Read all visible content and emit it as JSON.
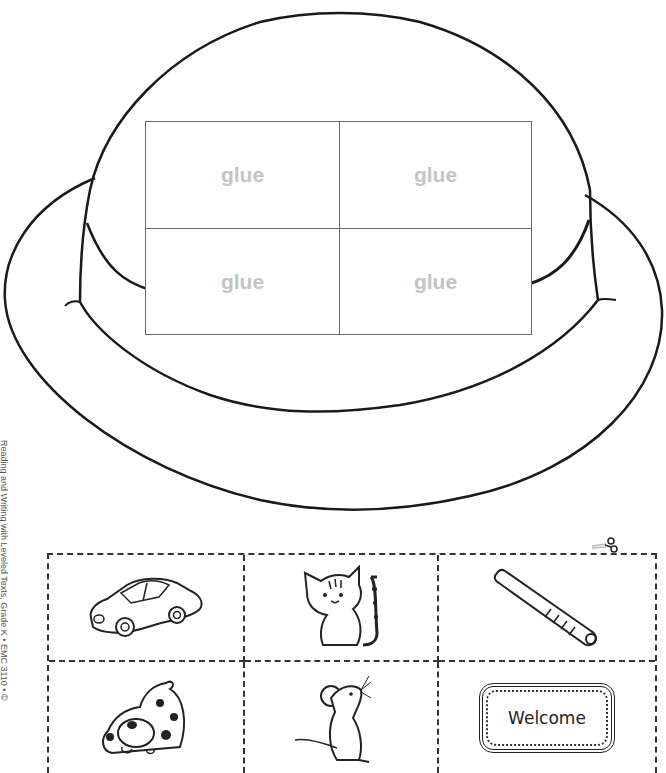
{
  "worksheet": {
    "title_visual": "hat",
    "glue_grid": {
      "cells": [
        {
          "label": "glue"
        },
        {
          "label": "glue"
        },
        {
          "label": "glue"
        },
        {
          "label": "glue"
        }
      ]
    },
    "side_credit": "Reading and Writing with Leveled Texts, Grade K • EMC 3110 • ©",
    "cut_grid": {
      "cells": [
        {
          "picture": "car-icon"
        },
        {
          "picture": "cat-icon"
        },
        {
          "picture": "bat-icon"
        },
        {
          "picture": "dog-icon"
        },
        {
          "picture": "mouse-icon"
        },
        {
          "picture": "welcome-mat-icon",
          "text": "Welcome"
        }
      ]
    },
    "scissors_icon": "scissors-icon"
  }
}
